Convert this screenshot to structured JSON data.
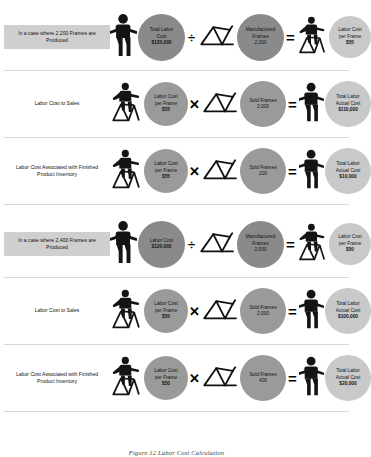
{
  "caption": "Figure 12 Labor Cost Calculation",
  "icons": {
    "worker_standing": "worker-standing-icon",
    "worker_on_frame": "worker-on-frame-icon",
    "bike_frame": "bicycle-frame-icon",
    "divide": "divide-operator-icon",
    "multiply": "multiply-operator-icon",
    "equals": "equals-operator-icon"
  },
  "operators": {
    "divide": "÷",
    "multiply": "✕",
    "equals": "=",
    "equals_alt": "="
  },
  "blocks": [
    {
      "id": "case-2200",
      "rows": [
        {
          "id": "row-produced-2200",
          "label": "In a case where 2,200 Frames are Produced",
          "label_boxed": true,
          "left_worker": "standing",
          "operand_a": {
            "lines": [
              "Total Labor",
              "Cost",
              "$120,000"
            ],
            "tone": "dark",
            "size": 47
          },
          "operator": "÷",
          "frame": true,
          "operand_b": {
            "lines": [
              "Manufactured",
              "Frames",
              "2,200"
            ],
            "tone": "dark",
            "size": 47
          },
          "result_worker": "on-frame",
          "result": {
            "lines": [
              "Labor Cost",
              "per Frame",
              "$55"
            ],
            "tone": "light",
            "size": 42
          }
        },
        {
          "id": "row-sales-2200",
          "label": "Labor Cost to Sales",
          "label_boxed": false,
          "left_worker": "on-frame",
          "operand_a": {
            "lines": [
              "Labor Cost",
              "per Frame",
              "$55"
            ],
            "tone": "mid",
            "size": 44
          },
          "operator": "✕",
          "frame": true,
          "operand_b": {
            "lines": [
              "Sold Frames",
              "2,000"
            ],
            "tone": "mid",
            "size": 46
          },
          "result_worker": "standing",
          "result": {
            "lines": [
              "Total Labor",
              "Actual Cost",
              "$110,000"
            ],
            "tone": "light",
            "size": 46
          }
        },
        {
          "id": "row-inventory-2200",
          "label": "Labor Cost Associated with Finished Product Inventory",
          "label_boxed": false,
          "left_worker": "on-frame",
          "operand_a": {
            "lines": [
              "Labor Cost",
              "per Frame",
              "$55"
            ],
            "tone": "mid",
            "size": 44
          },
          "operator": "✕",
          "frame": true,
          "operand_b": {
            "lines": [
              "Sold Frames",
              "200"
            ],
            "tone": "mid",
            "size": 46
          },
          "result_worker": "standing",
          "result": {
            "lines": [
              "Total Labor",
              "Actual Cost",
              "$10,000"
            ],
            "tone": "light",
            "size": 46
          }
        }
      ]
    },
    {
      "id": "case-2400",
      "rows": [
        {
          "id": "row-produced-2400",
          "label": "In a case where 2,400 Frames are Produced",
          "label_boxed": true,
          "left_worker": "standing",
          "operand_a": {
            "lines": [
              "Labor Cost",
              "$120,000"
            ],
            "tone": "dark",
            "size": 47
          },
          "operator": "÷",
          "frame": true,
          "operand_b": {
            "lines": [
              "Manufactured",
              "Frames",
              "2,000"
            ],
            "tone": "dark",
            "size": 47
          },
          "result_worker": "on-frame",
          "result": {
            "lines": [
              "Labor Cost",
              "per Frame",
              "$50"
            ],
            "tone": "light",
            "size": 42
          }
        },
        {
          "id": "row-sales-2400",
          "label": "Labor Cost to Sales",
          "label_boxed": false,
          "left_worker": "on-frame",
          "operand_a": {
            "lines": [
              "Labor Cost",
              "per Frame",
              "$55"
            ],
            "tone": "mid",
            "size": 44
          },
          "operator": "✕",
          "frame": true,
          "operand_b": {
            "lines": [
              "Sold Frames",
              "2,000"
            ],
            "tone": "mid",
            "size": 46
          },
          "result_worker": "standing",
          "result": {
            "lines": [
              "Total Labor",
              "Actual Cost",
              "$100,000"
            ],
            "tone": "light",
            "size": 46
          }
        },
        {
          "id": "row-inventory-2400",
          "label": "Labor Cost Associated with Finished Product Inventory",
          "label_boxed": false,
          "left_worker": "on-frame",
          "operand_a": {
            "lines": [
              "Labor Cost",
              "per Frame",
              "$50"
            ],
            "tone": "mid",
            "size": 44
          },
          "operator": "✕",
          "frame": true,
          "operand_b": {
            "lines": [
              "Sold Frames",
              "400"
            ],
            "tone": "mid",
            "size": 46
          },
          "result_worker": "standing",
          "result": {
            "lines": [
              "Total Labor",
              "Actual Cost",
              "$20,000"
            ],
            "tone": "light",
            "size": 46
          }
        }
      ]
    }
  ],
  "colors": {
    "circle_dark": "#8a8a8a",
    "circle_mid": "#9a9a9a",
    "circle_light": "#c9c9c9",
    "label_box": "#cfcfcf",
    "divider": "#d9d9d9",
    "text": "#141414"
  }
}
